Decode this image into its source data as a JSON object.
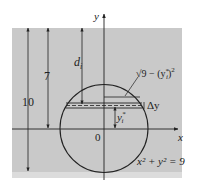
{
  "figure": {
    "colors": {
      "water": "#c9c9c9",
      "water_bottom_band": "#dcdcdc",
      "line": "#222222",
      "background": "#ffffff"
    },
    "labels": {
      "y_axis": "y",
      "x_axis": "x",
      "origin": "0",
      "depth_total": "10",
      "depth_center": "7",
      "depth_strip": "d",
      "depth_strip_sub": "i",
      "half_width": "√9 − (y",
      "half_width_sup": "*",
      "half_width_sub": "i",
      "half_width_close": ")",
      "half_width_pow": "2",
      "strip_height": "Δy",
      "strip_position": "y",
      "strip_position_sub": "i",
      "strip_position_sup": "*",
      "equation": "x² + y² = 9"
    }
  }
}
